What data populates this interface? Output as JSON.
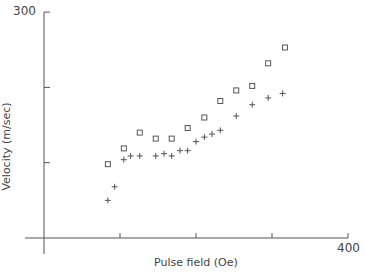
{
  "chart_data": {
    "type": "scatter",
    "title": "",
    "xlabel": "Pulse field (Oe)",
    "ylabel": "Velocity (m/sec)",
    "xlim": [
      0,
      400
    ],
    "ylim": [
      0,
      300
    ],
    "x_tick_labels": [
      "400"
    ],
    "y_tick_labels": [
      "300"
    ],
    "x_ticks": [
      100,
      200,
      300,
      400
    ],
    "y_ticks": [
      100,
      200,
      300
    ],
    "grid": false,
    "series": [
      {
        "name": "squares",
        "marker": "square",
        "points": [
          [
            84,
            98
          ],
          [
            105,
            119
          ],
          [
            126,
            140
          ],
          [
            147,
            132
          ],
          [
            168,
            132
          ],
          [
            189,
            146
          ],
          [
            211,
            160
          ],
          [
            232,
            182
          ],
          [
            253,
            196
          ],
          [
            274,
            202
          ],
          [
            295,
            232
          ],
          [
            317,
            253
          ]
        ]
      },
      {
        "name": "plus",
        "marker": "plus",
        "points": [
          [
            84,
            50
          ],
          [
            93,
            68
          ],
          [
            105,
            104
          ],
          [
            114,
            109
          ],
          [
            126,
            109
          ],
          [
            147,
            109
          ],
          [
            158,
            112
          ],
          [
            168,
            109
          ],
          [
            179,
            116
          ],
          [
            189,
            116
          ],
          [
            200,
            128
          ],
          [
            211,
            134
          ],
          [
            221,
            138
          ],
          [
            232,
            143
          ],
          [
            253,
            162
          ],
          [
            274,
            177
          ],
          [
            295,
            186
          ],
          [
            314,
            192
          ]
        ]
      }
    ]
  },
  "axes": {
    "x_label": "Pulse field (Oe)",
    "y_label": "Velocity (m/sec)",
    "x_max_label": "400",
    "y_max_label": "300"
  }
}
